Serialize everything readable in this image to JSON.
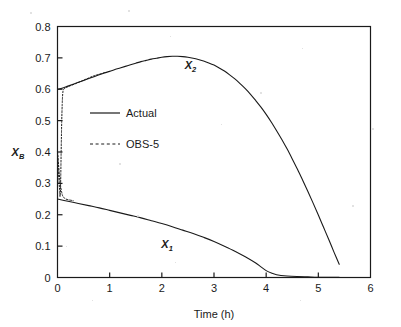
{
  "chart_data": {
    "type": "line",
    "title": "",
    "xlabel": "Time (h)",
    "ylabel": "X_B",
    "ylabel_main": "X",
    "ylabel_sub": "B",
    "xlim": [
      0,
      6
    ],
    "ylim": [
      0,
      0.8
    ],
    "xticks": [
      0,
      1,
      2,
      3,
      4,
      5,
      6
    ],
    "xtick_labels": [
      "0",
      "1",
      "2",
      "3",
      "4",
      "5",
      "6"
    ],
    "yticks": [
      0,
      0.1,
      0.2,
      0.3,
      0.4,
      0.5,
      0.6,
      0.7,
      0.8
    ],
    "ytick_labels": [
      "0",
      "0.1",
      "0.2",
      "0.3",
      "0.4",
      "0.5",
      "0.6",
      "0.7",
      "0.8"
    ],
    "grid": false,
    "legend_position": "upper-left-inside",
    "legend": [
      {
        "label": "Actual",
        "style": "solid"
      },
      {
        "label": "OBS-5",
        "style": "dashed"
      }
    ],
    "annotations": [
      {
        "text": "X",
        "sub": "2",
        "x": 2.55,
        "y": 0.665
      },
      {
        "text": "X",
        "sub": "1",
        "x": 2.1,
        "y": 0.095
      }
    ],
    "series": [
      {
        "name": "X2 Actual",
        "label": "X_2",
        "style": "solid",
        "color": "#1a1a1a",
        "points": [
          [
            0.0,
            0.6
          ],
          [
            0.1,
            0.604
          ],
          [
            0.2,
            0.61
          ],
          [
            0.3,
            0.616
          ],
          [
            0.4,
            0.622
          ],
          [
            0.5,
            0.628
          ],
          [
            0.6,
            0.634
          ],
          [
            0.7,
            0.64
          ],
          [
            0.8,
            0.646
          ],
          [
            0.9,
            0.652
          ],
          [
            1.0,
            0.657
          ],
          [
            1.1,
            0.663
          ],
          [
            1.2,
            0.668
          ],
          [
            1.3,
            0.673
          ],
          [
            1.4,
            0.678
          ],
          [
            1.5,
            0.683
          ],
          [
            1.6,
            0.688
          ],
          [
            1.7,
            0.692
          ],
          [
            1.8,
            0.696
          ],
          [
            1.9,
            0.699
          ],
          [
            2.0,
            0.702
          ],
          [
            2.1,
            0.704
          ],
          [
            2.2,
            0.705
          ],
          [
            2.3,
            0.705
          ],
          [
            2.4,
            0.704
          ],
          [
            2.5,
            0.702
          ],
          [
            2.6,
            0.699
          ],
          [
            2.7,
            0.695
          ],
          [
            2.8,
            0.69
          ],
          [
            2.9,
            0.684
          ],
          [
            3.0,
            0.677
          ],
          [
            3.1,
            0.668
          ],
          [
            3.2,
            0.658
          ],
          [
            3.3,
            0.646
          ],
          [
            3.4,
            0.633
          ],
          [
            3.5,
            0.618
          ],
          [
            3.6,
            0.602
          ],
          [
            3.7,
            0.584
          ],
          [
            3.8,
            0.564
          ],
          [
            3.9,
            0.543
          ],
          [
            4.0,
            0.52
          ],
          [
            4.1,
            0.495
          ],
          [
            4.2,
            0.468
          ],
          [
            4.3,
            0.44
          ],
          [
            4.4,
            0.41
          ],
          [
            4.5,
            0.378
          ],
          [
            4.6,
            0.345
          ],
          [
            4.7,
            0.31
          ],
          [
            4.8,
            0.274
          ],
          [
            4.9,
            0.237
          ],
          [
            5.0,
            0.199
          ],
          [
            5.1,
            0.16
          ],
          [
            5.2,
            0.121
          ],
          [
            5.3,
            0.081
          ],
          [
            5.4,
            0.042
          ]
        ]
      },
      {
        "name": "X1 Actual",
        "label": "X_1",
        "style": "solid",
        "color": "#1a1a1a",
        "points": [
          [
            0.0,
            0.25
          ],
          [
            0.2,
            0.243
          ],
          [
            0.4,
            0.236
          ],
          [
            0.6,
            0.229
          ],
          [
            0.8,
            0.222
          ],
          [
            1.0,
            0.214
          ],
          [
            1.2,
            0.206
          ],
          [
            1.4,
            0.198
          ],
          [
            1.6,
            0.19
          ],
          [
            1.8,
            0.181
          ],
          [
            2.0,
            0.172
          ],
          [
            2.2,
            0.162
          ],
          [
            2.4,
            0.151
          ],
          [
            2.6,
            0.14
          ],
          [
            2.8,
            0.128
          ],
          [
            3.0,
            0.115
          ],
          [
            3.2,
            0.1
          ],
          [
            3.4,
            0.084
          ],
          [
            3.6,
            0.066
          ],
          [
            3.8,
            0.046
          ],
          [
            3.9,
            0.034
          ],
          [
            4.0,
            0.022
          ],
          [
            4.1,
            0.014
          ],
          [
            4.2,
            0.009
          ],
          [
            4.4,
            0.005
          ],
          [
            4.6,
            0.003
          ],
          [
            4.8,
            0.002
          ],
          [
            5.0,
            0.001
          ],
          [
            5.4,
            0.001
          ]
        ]
      },
      {
        "name": "X2 OBS-5",
        "label": "OBS-5 upper",
        "style": "dashed",
        "color": "#1a1a1a",
        "points": [
          [
            0.0,
            0.4
          ],
          [
            0.02,
            0.33
          ],
          [
            0.04,
            0.28
          ],
          [
            0.05,
            0.258
          ],
          [
            0.06,
            0.3
          ],
          [
            0.07,
            0.4
          ],
          [
            0.08,
            0.49
          ],
          [
            0.09,
            0.55
          ],
          [
            0.1,
            0.585
          ],
          [
            0.12,
            0.6
          ],
          [
            0.2,
            0.608
          ],
          [
            0.35,
            0.618
          ],
          [
            0.5,
            0.629
          ],
          [
            0.6,
            0.636
          ],
          [
            0.7,
            0.643
          ],
          [
            0.8,
            0.648
          ],
          [
            0.9,
            0.653
          ]
        ]
      },
      {
        "name": "X1 OBS-5",
        "label": "OBS-5 lower",
        "style": "dashed",
        "color": "#1a1a1a",
        "points": [
          [
            0.0,
            0.4
          ],
          [
            0.02,
            0.36
          ],
          [
            0.04,
            0.32
          ],
          [
            0.06,
            0.29
          ],
          [
            0.08,
            0.272
          ],
          [
            0.1,
            0.26
          ],
          [
            0.14,
            0.252
          ],
          [
            0.2,
            0.248
          ],
          [
            0.3,
            0.245
          ]
        ]
      }
    ]
  }
}
